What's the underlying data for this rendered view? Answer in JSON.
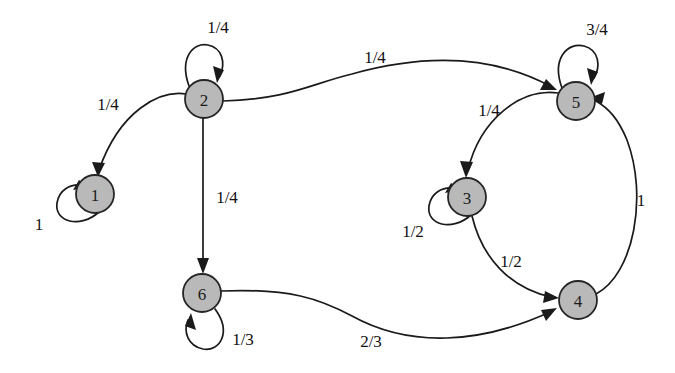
{
  "figure": {
    "type": "state-transition-diagram",
    "title": "",
    "background_color": "#ffffff",
    "node_fill_color": "#b9b9b9",
    "node_stroke_color": "#262626",
    "edge_color": "#1a1a1a"
  },
  "nodes": [
    {
      "id": "1",
      "label": "1",
      "cx": 95,
      "cy": 194,
      "r": 19
    },
    {
      "id": "2",
      "label": "2",
      "cx": 204,
      "cy": 99,
      "r": 19
    },
    {
      "id": "3",
      "label": "3",
      "cx": 467,
      "cy": 197,
      "r": 19
    },
    {
      "id": "4",
      "label": "4",
      "cx": 578,
      "cy": 300,
      "r": 19
    },
    {
      "id": "5",
      "label": "5",
      "cx": 576,
      "cy": 101,
      "r": 19
    },
    {
      "id": "6",
      "label": "6",
      "cx": 202,
      "cy": 293,
      "r": 19
    }
  ],
  "edges": [
    {
      "from": "1",
      "to": "1",
      "label": "1",
      "kind": "self-loop",
      "label_x": 39,
      "label_y": 224
    },
    {
      "from": "2",
      "to": "2",
      "label": "1/4",
      "kind": "self-loop",
      "label_x": 218,
      "label_y": 27
    },
    {
      "from": "2",
      "to": "1",
      "label": "1/4",
      "kind": "curve",
      "label_x": 108,
      "label_y": 104
    },
    {
      "from": "2",
      "to": "6",
      "label": "1/4",
      "kind": "straight",
      "label_x": 227,
      "label_y": 197
    },
    {
      "from": "2",
      "to": "5",
      "label": "1/4",
      "kind": "curve",
      "label_x": 375,
      "label_y": 57
    },
    {
      "from": "5",
      "to": "5",
      "label": "3/4",
      "kind": "self-loop",
      "label_x": 597,
      "label_y": 29
    },
    {
      "from": "5",
      "to": "3",
      "label": "1/4",
      "kind": "curve",
      "label_x": 489,
      "label_y": 110
    },
    {
      "from": "3",
      "to": "3",
      "label": "1/2",
      "kind": "self-loop",
      "label_x": 413,
      "label_y": 231
    },
    {
      "from": "3",
      "to": "4",
      "label": "1/2",
      "kind": "curve",
      "label_x": 511,
      "label_y": 261
    },
    {
      "from": "4",
      "to": "5",
      "label": "1",
      "kind": "curve",
      "label_x": 641,
      "label_y": 200
    },
    {
      "from": "6",
      "to": "6",
      "label": "1/3",
      "kind": "self-loop",
      "label_x": 243,
      "label_y": 339
    },
    {
      "from": "6",
      "to": "4",
      "label": "2/3",
      "kind": "curve",
      "label_x": 371,
      "label_y": 341
    }
  ]
}
